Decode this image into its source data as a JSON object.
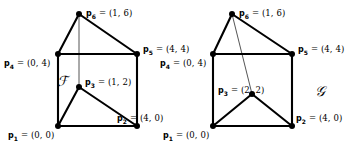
{
  "figure": {
    "caption_left": "F",
    "caption_right": "G",
    "colors": {
      "edge": "#000000",
      "thin_edge": "#555555",
      "vertex": "#000000",
      "background": "#ffffff"
    }
  },
  "left_polygon": {
    "name": "F",
    "set_label": "ℱ",
    "vertices": [
      {
        "id": "p1",
        "label_bold": "p",
        "sub": "1",
        "eq": "= (0, 0)",
        "coord": [
          0,
          0
        ],
        "px": [
          58,
          126
        ],
        "label_pos": [
          8,
          131
        ]
      },
      {
        "id": "p2",
        "label_bold": "p",
        "sub": "2",
        "eq": "= (4, 0)",
        "coord": [
          4,
          0
        ],
        "px": [
          137,
          126
        ],
        "label_pos": [
          117,
          114
        ]
      },
      {
        "id": "p3",
        "label_bold": "p",
        "sub": "3",
        "eq": "= (1, 2)",
        "coord": [
          1,
          2
        ],
        "px": [
          79,
          87
        ],
        "label_pos": [
          85,
          78
        ]
      },
      {
        "id": "p4",
        "label_bold": "p",
        "sub": "4",
        "eq": "= (0, 4)",
        "coord": [
          0,
          4
        ],
        "px": [
          58,
          54
        ],
        "label_pos": [
          4,
          59
        ]
      },
      {
        "id": "p5",
        "label_bold": "p",
        "sub": "5",
        "eq": "= (4, 4)",
        "coord": [
          4,
          4
        ],
        "px": [
          137,
          54
        ],
        "label_pos": [
          143,
          45
        ]
      },
      {
        "id": "p6",
        "label_bold": "p",
        "sub": "6",
        "eq": "= (1, 6)",
        "coord": [
          1,
          6
        ],
        "px": [
          79,
          14
        ],
        "label_pos": [
          86,
          9
        ]
      }
    ],
    "thick_edges": [
      [
        "p1",
        "p2"
      ],
      [
        "p2",
        "p5"
      ],
      [
        "p5",
        "p6"
      ],
      [
        "p6",
        "p4"
      ],
      [
        "p4",
        "p1"
      ],
      [
        "p4",
        "p5"
      ],
      [
        "p1",
        "p3"
      ],
      [
        "p3",
        "p2"
      ]
    ],
    "thin_edges": [
      [
        "p6",
        "p3"
      ]
    ],
    "set_label_pos": [
      57,
      73
    ]
  },
  "right_polygon": {
    "name": "G",
    "set_label": "𝒢",
    "vertices": [
      {
        "id": "p1",
        "label_bold": "p",
        "sub": "1",
        "eq": "= (0, 0)",
        "coord": [
          0,
          0
        ],
        "px": [
          213,
          126
        ],
        "label_pos": [
          163,
          131
        ]
      },
      {
        "id": "p2",
        "label_bold": "p",
        "sub": "2",
        "eq": "= (4, 0)",
        "coord": [
          4,
          0
        ],
        "px": [
          292,
          126
        ],
        "label_pos": [
          296,
          114
        ]
      },
      {
        "id": "p3",
        "label_bold": "p",
        "sub": "3",
        "eq": "= (2, 2)",
        "coord": [
          2,
          2
        ],
        "px": [
          252,
          94
        ],
        "label_pos": [
          218,
          86
        ]
      },
      {
        "id": "p4",
        "label_bold": "p",
        "sub": "4",
        "eq": "= (0, 4)",
        "coord": [
          0,
          4
        ],
        "px": [
          213,
          54
        ],
        "label_pos": [
          160,
          59
        ]
      },
      {
        "id": "p5",
        "label_bold": "p",
        "sub": "5",
        "eq": "= (4, 4)",
        "coord": [
          4,
          4
        ],
        "px": [
          292,
          54
        ],
        "label_pos": [
          298,
          45
        ]
      },
      {
        "id": "p6",
        "label_bold": "p",
        "sub": "6",
        "eq": "= (1, 6)",
        "coord": [
          1,
          6
        ],
        "px": [
          232,
          14
        ],
        "label_pos": [
          239,
          9
        ]
      }
    ],
    "thick_edges": [
      [
        "p1",
        "p2"
      ],
      [
        "p2",
        "p5"
      ],
      [
        "p5",
        "p6"
      ],
      [
        "p6",
        "p4"
      ],
      [
        "p4",
        "p1"
      ],
      [
        "p4",
        "p5"
      ],
      [
        "p1",
        "p3"
      ],
      [
        "p3",
        "p2"
      ]
    ],
    "thin_edges": [
      [
        "p6",
        "p3"
      ]
    ],
    "set_label_pos": [
      315,
      83
    ]
  }
}
